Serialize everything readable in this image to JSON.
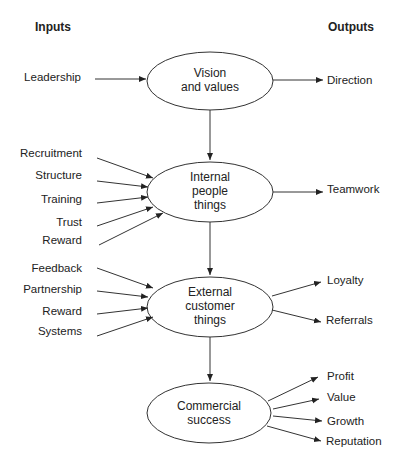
{
  "headers": {
    "inputs": "Inputs",
    "outputs": "Outputs"
  },
  "nodes": [
    {
      "id": "vision",
      "lines": [
        "Vision",
        "and values"
      ],
      "cx": 210,
      "cy": 81,
      "rx": 63,
      "ry": 29
    },
    {
      "id": "internal",
      "lines": [
        "Internal",
        "people",
        "things"
      ],
      "cx": 210,
      "cy": 192,
      "rx": 63,
      "ry": 30
    },
    {
      "id": "external",
      "lines": [
        "External",
        "customer",
        "things"
      ],
      "cx": 210,
      "cy": 307,
      "rx": 63,
      "ry": 30
    },
    {
      "id": "commercial",
      "lines": [
        "Commercial",
        "success"
      ],
      "cx": 209,
      "cy": 413,
      "rx": 62,
      "ry": 30
    }
  ],
  "inputs": {
    "vision": [
      "Leadership"
    ],
    "internal": [
      "Recruitment",
      "Structure",
      "Training",
      "Trust",
      "Reward"
    ],
    "external": [
      "Feedback",
      "Partnership",
      "Reward",
      "Systems"
    ]
  },
  "outputs": {
    "vision": [
      "Direction"
    ],
    "internal": [
      "Teamwork"
    ],
    "external": [
      "Loyalty",
      "Referrals"
    ],
    "commercial": [
      "Profit",
      "Value",
      "Growth",
      "Reputation"
    ]
  }
}
